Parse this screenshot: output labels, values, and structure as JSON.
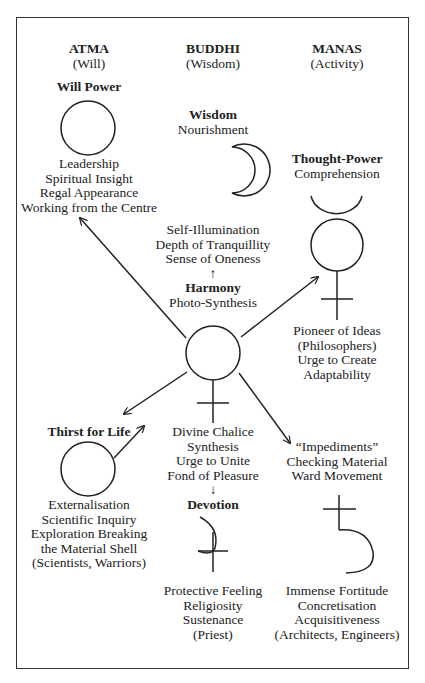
{
  "columns": [
    {
      "title": "ATMA",
      "subtitle": "(Will)"
    },
    {
      "title": "BUDDHI",
      "subtitle": "(Wisdom)"
    },
    {
      "title": "MANAS",
      "subtitle": "(Activity)"
    }
  ],
  "nodes": {
    "will_power": {
      "heading": "Will Power",
      "symbol": "sun-circle",
      "lines": [
        "Leadership",
        "Spiritual Insight",
        "Regal Appearance",
        "Working from the Centre"
      ]
    },
    "wisdom": {
      "heading": "Wisdom",
      "subheading": "Nourishment",
      "symbol": "moon-crescent",
      "lines": [
        "Self-Illumination",
        "Depth of Tranquillity",
        "Sense of Oneness"
      ]
    },
    "harmony": {
      "arrow_up": "↑",
      "heading": "Harmony",
      "subheading": "Photo-Synthesis",
      "symbol": "venus"
    },
    "thought_power": {
      "heading": "Thought-Power",
      "subheading": "Comprehension",
      "symbol": "mercury",
      "lines": [
        "Pioneer of Ideas",
        "(Philosophers)",
        "Urge to Create",
        "Adaptability"
      ]
    },
    "thirst_for_life": {
      "heading": "Thirst for Life",
      "symbol": "mars",
      "lines": [
        "Externalisation",
        "Scientific Inquiry",
        "Exploration Breaking",
        "the Material Shell",
        "(Scientists, Warriors)"
      ]
    },
    "divine_chalice": {
      "lines": [
        "Divine Chalice",
        "Synthesis",
        "Urge to Unite",
        "Fond of Pleasure"
      ],
      "arrow_down": "↓"
    },
    "devotion": {
      "heading": "Devotion",
      "symbol": "jupiter",
      "lines": [
        "Protective Feeling",
        "Religiosity",
        "Sustenance",
        "(Priest)"
      ]
    },
    "impediments": {
      "lines": [
        "“Impediments”",
        "Checking Material",
        "Ward Movement"
      ],
      "symbol": "saturn",
      "lines2": [
        "Immense Fortitude",
        "Concretisation",
        "Acquisitiveness",
        "(Architects, Engineers)"
      ]
    }
  },
  "colors": {
    "ink": "#222222",
    "frame": "#333333",
    "background": "#ffffff"
  }
}
